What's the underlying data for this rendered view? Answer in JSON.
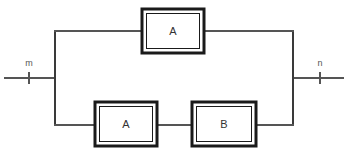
{
  "diagram": {
    "background_color": "#ffffff",
    "wire_color": "#555555",
    "rail_color": "#3a3a3a",
    "box_stroke_color": "#1a1a1a",
    "box_fill_color": "#ffffff",
    "label_color": "#333333",
    "width": 348,
    "height": 158,
    "ports": [
      {
        "id": "input",
        "label": "m",
        "side": "left",
        "label_x": 29,
        "label_y": 66,
        "tick_x": 29,
        "tick_y1": 72,
        "tick_y2": 84
      },
      {
        "id": "output",
        "label": "n",
        "side": "right",
        "label_x": 320,
        "label_y": 66,
        "tick_x": 320,
        "tick_y1": 72,
        "tick_y2": 84
      }
    ],
    "blocks": [
      {
        "id": "top-a",
        "label": "A",
        "branch": "upper",
        "x": 142,
        "y": 9,
        "width": 62,
        "height": 44,
        "center_x": 173,
        "center_y": 31
      },
      {
        "id": "bottom-a",
        "label": "A",
        "branch": "lower",
        "x": 95,
        "y": 102,
        "width": 62,
        "height": 44,
        "center_x": 126,
        "center_y": 124
      },
      {
        "id": "bottom-b",
        "label": "B",
        "branch": "lower",
        "x": 192,
        "y": 102,
        "width": 64,
        "height": 44,
        "center_x": 224,
        "center_y": 124
      }
    ],
    "geometry": {
      "center_line_y": 78,
      "upper_rail_y": 31,
      "lower_rail_y": 125,
      "left_rail_x": 55,
      "right_rail_x": 293,
      "left_lead_start_x": 4,
      "right_lead_end_x": 344
    }
  }
}
